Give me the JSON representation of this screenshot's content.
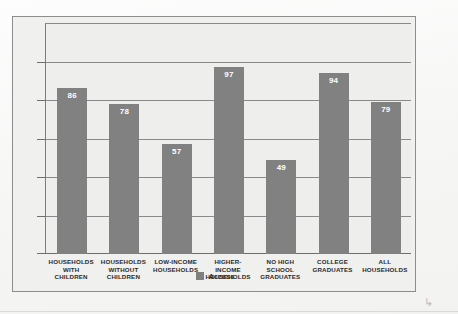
{
  "chart_data": {
    "type": "bar",
    "title": "",
    "subtitle": "",
    "xlabel": "",
    "ylabel": "",
    "ylim": [
      0,
      120
    ],
    "grid": true,
    "gridlines": [
      0,
      20,
      40,
      60,
      80,
      100,
      120
    ],
    "axis_tick_labels_visible": false,
    "legend_position": "bottom-center",
    "categories": [
      "HOUSEHOLDS WITH CHILDREN",
      "HOUSEHOLDS WITHOUT CHILDREN",
      "LOW-INCOME HOUSEHOLDS",
      "HIGHER-INCOME HOUSEHOLDS",
      "NO HIGH SCHOOL GRADUATES",
      "COLLEGE GRADUATES",
      "ALL HOUSEHOLDS"
    ],
    "category_lines": [
      [
        "HOUSEHOLDS",
        "WITH",
        "CHILDREN"
      ],
      [
        "HOUSEHOLDS",
        "WITHOUT",
        "CHILDREN"
      ],
      [
        "LOW-INCOME",
        "HOUSEHOLDS"
      ],
      [
        "HIGHER-",
        "INCOME",
        "HOUSEHOLDS"
      ],
      [
        "NO HIGH",
        "SCHOOL",
        "GRADUATES"
      ],
      [
        "COLLEGE",
        "GRADUATES"
      ],
      [
        "ALL",
        "HOUSEHOLDS"
      ]
    ],
    "series": [
      {
        "name": "Access",
        "color": "#818181",
        "values": [
          86,
          78,
          57,
          97,
          49,
          94,
          79
        ]
      }
    ],
    "legend": [
      {
        "label": "Access",
        "color": "#7f7f7f"
      }
    ]
  },
  "colors": {
    "bar": "#818181",
    "plot_background": "#eeeeec",
    "figure_background": "#f0f0ee",
    "frame_border": "#8d8d8d",
    "gridline": "#8a8a8a",
    "axis": "#6e6e6e",
    "value_label": "#ffffff",
    "category_label": "#2b2b2b"
  },
  "artifacts": {
    "scan_mark": "↳"
  }
}
